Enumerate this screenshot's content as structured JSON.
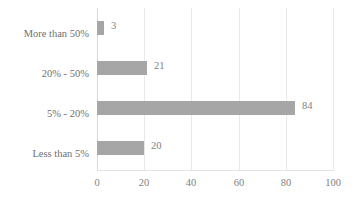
{
  "chart_data": {
    "type": "bar",
    "orientation": "horizontal",
    "title": "",
    "xlabel": "",
    "ylabel": "",
    "categories": [
      "More than 50%",
      "20% - 50%",
      "5% - 20%",
      "Less than 5%"
    ],
    "values": [
      3,
      21,
      84,
      20
    ],
    "data_labels": [
      "3",
      "21",
      "84",
      "20"
    ],
    "xlim": [
      0,
      100
    ],
    "xticks": [
      0,
      20,
      40,
      60,
      80,
      100
    ],
    "xtick_labels": [
      "0",
      "20",
      "40",
      "60",
      "80",
      "100"
    ],
    "grid": "vertical",
    "legend": "none",
    "series": [
      {
        "name": "",
        "values": [
          3,
          21,
          84,
          20
        ],
        "color": "#a6a6a6"
      }
    ]
  },
  "style": {
    "bar_color": "#a6a6a6",
    "gridline_color": "#e8e8e8",
    "axis_color": "#d9d9d9",
    "text_color": "#7f7f7f",
    "background": "#ffffff"
  }
}
